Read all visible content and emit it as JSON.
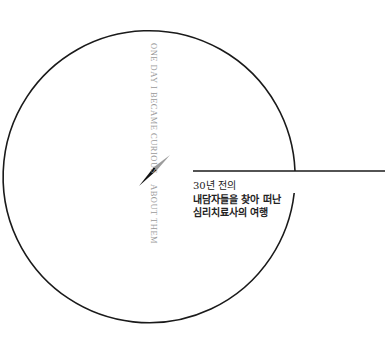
{
  "cover": {
    "vertical_text_top": "ONE DAY I BECAME CURIOUS",
    "vertical_text_bottom": "ABOUT THEM",
    "caption": [
      "30년 전의",
      "내담자들을 찾아 떠난",
      "심리치료사의 여행"
    ]
  },
  "colors": {
    "background": "#ffffff",
    "line": "#1a1a1a",
    "vertical_text": "#9a9a9a",
    "needle_dark": "#111111",
    "needle_light": "#9c9c9c"
  }
}
